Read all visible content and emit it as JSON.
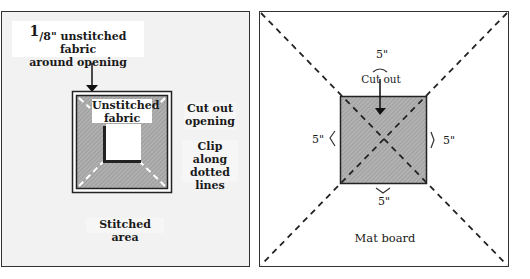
{
  "left_diagram": {
    "fraction_numerator": "1",
    "top_label_line1": "/8\" unstitched fabric",
    "top_label_line2": "around opening",
    "inner_label_line1": "Unstitched",
    "inner_label_line2": "fabric",
    "cut_label_line1": "Cut out",
    "cut_label_line2": "opening",
    "clip_label_line1": "Clip along",
    "clip_label_line2": "dotted",
    "clip_label_line3": "lines",
    "bottom_label": "Stitched area",
    "colors": {
      "background": "#f2f2f2",
      "frame": "#222222",
      "fabric": "#a8a8a8",
      "opening": "#ffffff"
    }
  },
  "right_diagram": {
    "top_measure": "5\"",
    "cut_label": "Cut out",
    "left_measure": "5\"",
    "right_measure": "5\"",
    "bottom_measure": "5\"",
    "bottom_label": "Mat board",
    "colors": {
      "background": "#ffffff",
      "square": "#a9a9a9",
      "dash": "#222222"
    }
  }
}
